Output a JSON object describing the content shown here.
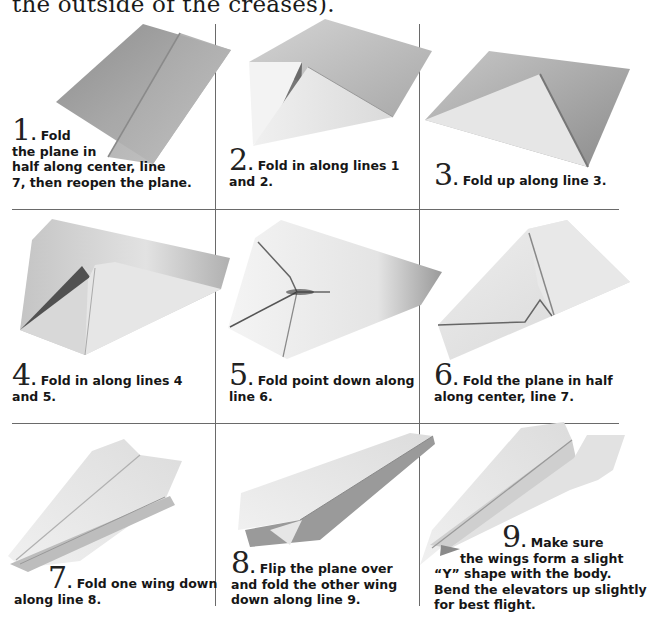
{
  "intro_text": "the outside of the creases).",
  "steps": [
    {
      "number": "1",
      "lines": [
        "Fold",
        "the plane in",
        "half along center, line",
        "7, then reopen the plane."
      ]
    },
    {
      "number": "2",
      "lines": [
        "Fold in along lines 1",
        "and 2."
      ]
    },
    {
      "number": "3",
      "lines": [
        "Fold up along line 3."
      ]
    },
    {
      "number": "4",
      "lines": [
        "Fold in along lines 4",
        "and 5."
      ]
    },
    {
      "number": "5",
      "lines": [
        "Fold point down along",
        "line 6."
      ]
    },
    {
      "number": "6",
      "lines": [
        "Fold the plane in half",
        "along center, line 7."
      ]
    },
    {
      "number": "7",
      "lines": [
        "Fold one wing down",
        "along line 8."
      ]
    },
    {
      "number": "8",
      "lines": [
        "Flip the plane over",
        "and fold the other wing",
        "down along line 9."
      ]
    },
    {
      "number": "9",
      "lines": [
        "Make sure",
        "the wings form a slight",
        "“Y” shape with the body.",
        "Bend the elevators up slightly",
        "for best flight."
      ]
    }
  ],
  "punctuation": ".",
  "colors": {
    "grid_line": "#6a6a6a",
    "paper_dark": "#9a9a9a",
    "paper_light": "#f2f2f2",
    "text": "#161616"
  }
}
